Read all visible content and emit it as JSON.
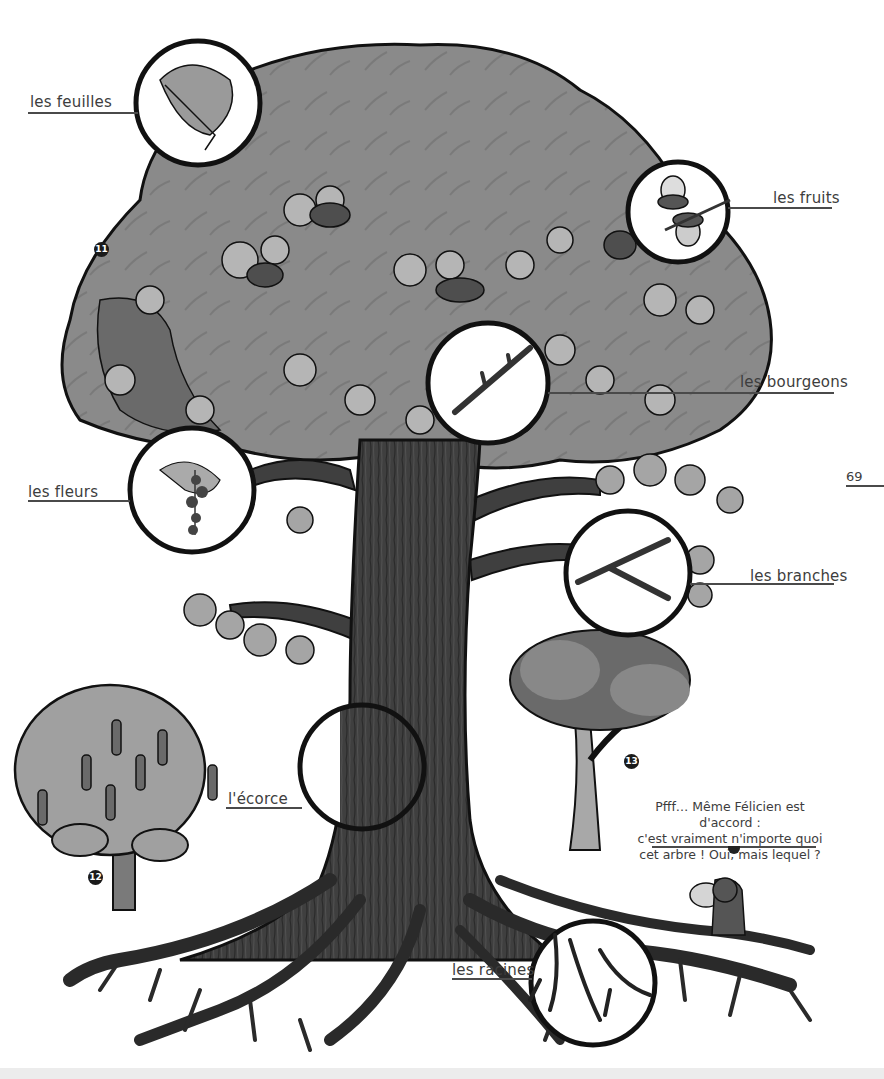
{
  "page": {
    "page_number": "69"
  },
  "labels": {
    "leaves": "les feuilles",
    "fruits": "les fruits",
    "buds": "les bourgeons",
    "flowers": "les fleurs",
    "branches": "les branches",
    "bark": "l'écorce",
    "roots": "les racines"
  },
  "badges": {
    "b11": "11",
    "b12": "12",
    "b13": "13"
  },
  "speech": {
    "line1": "Pfff… Même Félicien est d'accord :",
    "line2": "c'est vraiment n'importe quoi",
    "line3": "cet arbre ! Oui, mais lequel ?"
  },
  "colors": {
    "canopy": "#8a8a8a",
    "canopy_dark": "#5e5e5e",
    "leaf_light": "#b5b5b5",
    "trunk": "#3f3f3f",
    "outline": "#111111",
    "label_text": "#3d3d3d"
  }
}
